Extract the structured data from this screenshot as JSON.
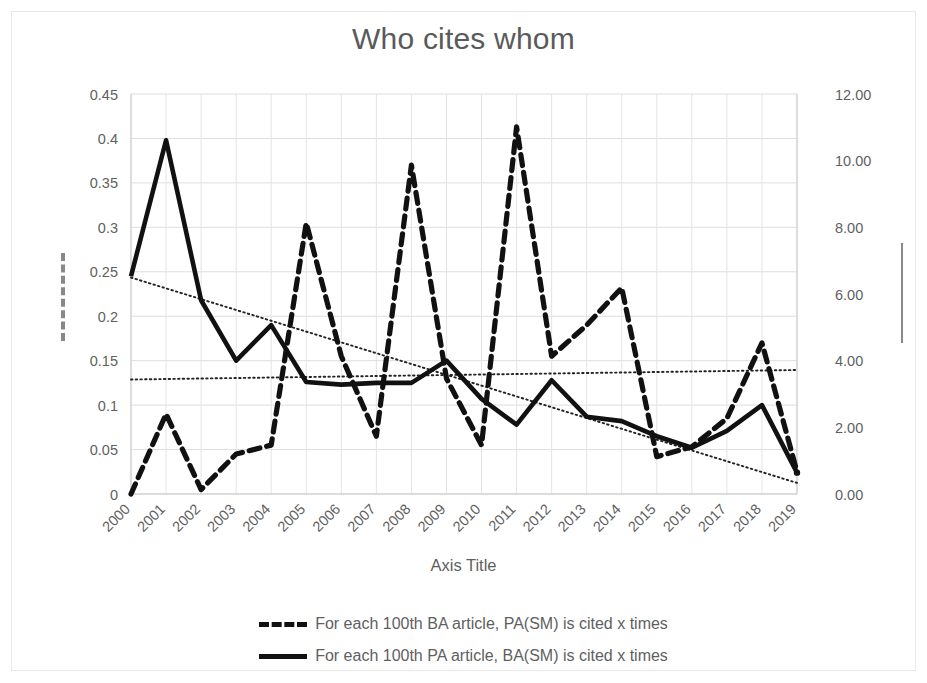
{
  "chart_data": {
    "type": "line",
    "title": "Who cites whom",
    "xlabel": "Axis Title",
    "ylabel": "",
    "grid": true,
    "legend_position": "bottom",
    "categories": [
      "2000",
      "2001",
      "2002",
      "2003",
      "2004",
      "2005",
      "2006",
      "2007",
      "2008",
      "2009",
      "2010",
      "2011",
      "2012",
      "2013",
      "2014",
      "2015",
      "2016",
      "2017",
      "2018",
      "2019"
    ],
    "y_left_ticks": [
      "0",
      "0.05",
      "0.1",
      "0.15",
      "0.2",
      "0.25",
      "0.3",
      "0.35",
      "0.4",
      "0.45"
    ],
    "y_right_ticks": [
      "0.00",
      "2.00",
      "4.00",
      "6.00",
      "8.00",
      "10.00",
      "12.00"
    ],
    "ylim_left": [
      0,
      0.45
    ],
    "ylim_right": [
      0,
      12
    ],
    "series": [
      {
        "name": "For each 100th BA article, PA(SM) is cited x times",
        "style": "dashed",
        "axis": "left",
        "color": "#111111",
        "values": [
          0.0,
          0.09,
          0.005,
          0.045,
          0.055,
          0.305,
          0.155,
          0.065,
          0.37,
          0.13,
          0.055,
          0.413,
          0.155,
          0.19,
          0.232,
          0.042,
          0.053,
          0.085,
          0.17,
          0.025
        ]
      },
      {
        "name": "For each 100th PA article, BA(SM) is cited x times",
        "style": "solid",
        "axis": "left",
        "color": "#111111",
        "values": [
          0.245,
          0.398,
          0.218,
          0.15,
          0.19,
          0.126,
          0.123,
          0.125,
          0.125,
          0.15,
          0.107,
          0.078,
          0.128,
          0.087,
          0.082,
          0.065,
          0.052,
          0.071,
          0.1,
          0.024
        ]
      }
    ],
    "trendlines": [
      {
        "name": "trendline-declining",
        "style": "dotted",
        "from": {
          "x_index": 0,
          "y": 0.2435
        },
        "to": {
          "x_index": 19,
          "y": 0.0125
        }
      },
      {
        "name": "trendline-flat",
        "style": "dotted",
        "from": {
          "x_index": 0,
          "y": 0.1288
        },
        "to": {
          "x_index": 19,
          "y": 0.1395
        }
      }
    ],
    "final_point_marker": {
      "x_index": 19,
      "y": 0.024
    }
  },
  "legend": {
    "entries": [
      {
        "label": "For each 100th BA article, PA(SM) is cited x times",
        "style": "dashed"
      },
      {
        "label": "For each 100th PA article, BA(SM) is cited x times",
        "style": "solid"
      }
    ]
  },
  "axis_title": "Axis Title",
  "title": "Who cites whom"
}
